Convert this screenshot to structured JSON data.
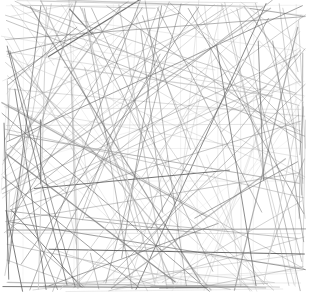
{
  "artwork": {
    "title": "Random Line Field",
    "type": "generative-line-art",
    "medium": "straight line segments",
    "canvas": {
      "width": 309,
      "height": 295,
      "background_color": "#ffffff"
    },
    "plot_area": {
      "x": 6,
      "y": 4,
      "width": 295,
      "height": 283,
      "background_color": "#ffffff"
    },
    "stroke": {
      "colors": [
        "#4a4a4a",
        "#565656",
        "#636363",
        "#6e6e6e",
        "#7a7a7a",
        "#858585",
        "#919191",
        "#9c9c9c",
        "#a8a8a8",
        "#b4b4b4",
        "#c0c0c0",
        "#cccccc"
      ],
      "widths": [
        0.4,
        0.5,
        0.6,
        0.7,
        0.8,
        0.9,
        1.0,
        1.2
      ],
      "opacity_range": [
        0.35,
        0.95
      ],
      "linecap": "butt"
    },
    "composition": {
      "segment_count": 190,
      "generation": "pseudo-random endpoints on and near the plot boundary",
      "seed": 20240517,
      "density": "dense",
      "angle_distribution": "uniform-random",
      "notes": "Segments span edge to edge producing a woven crosshatch texture; a handful of near-horizontal and near-vertical lines read as faint grid rules."
    }
  },
  "chart_data": {
    "type": "scatter",
    "xlabel": "",
    "ylabel": "",
    "xlim": [
      0,
      295
    ],
    "ylim": [
      0,
      283
    ],
    "grid": false,
    "legend": null,
    "series": [
      {
        "name": "line-segments",
        "description": "190 random straight segments drawn between random points within the square plot area",
        "values": []
      }
    ]
  }
}
